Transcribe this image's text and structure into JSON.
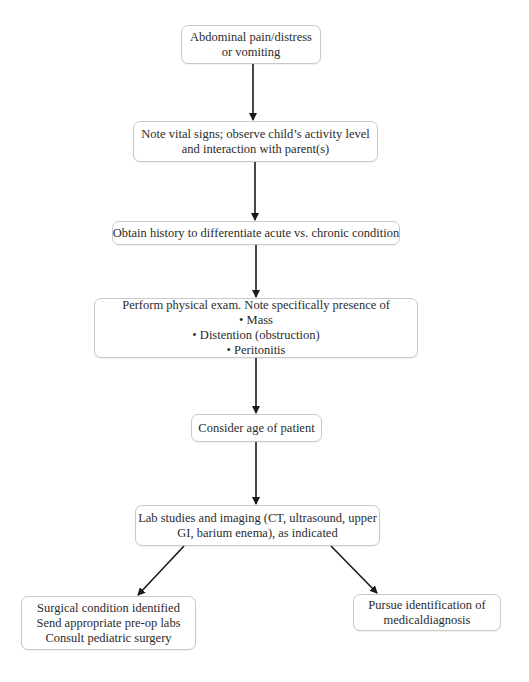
{
  "diagram": {
    "type": "flowchart",
    "top_cut_text": "",
    "nodes": [
      {
        "id": "start",
        "lines": [
          "Abdominal pain/distress",
          "or vomiting"
        ]
      },
      {
        "id": "vitals",
        "lines": [
          "Note vital signs; observe child’s activity level",
          "and interaction with parent(s)"
        ]
      },
      {
        "id": "history",
        "lines": [
          "Obtain history to differentiate acute vs. chronic condition"
        ]
      },
      {
        "id": "exam",
        "lines": [
          "Perform physical exam. Note specifically presence of",
          "• Mass",
          "• Distention (obstruction)",
          "• Peritonitis"
        ]
      },
      {
        "id": "age",
        "lines": [
          "Consider age of patient"
        ]
      },
      {
        "id": "labs",
        "lines": [
          "Lab studies and imaging (CT, ultrasound, upper",
          "GI, barium enema), as indicated"
        ]
      },
      {
        "id": "surgical",
        "lines": [
          "Surgical condition identified",
          "Send appropriate pre-op labs",
          "Consult pediatric surgery"
        ]
      },
      {
        "id": "medical",
        "lines": [
          "Pursue identification of",
          "medicaldiagnosis"
        ]
      }
    ],
    "edges": [
      {
        "from": "start",
        "to": "vitals"
      },
      {
        "from": "vitals",
        "to": "history"
      },
      {
        "from": "history",
        "to": "exam"
      },
      {
        "from": "exam",
        "to": "age"
      },
      {
        "from": "age",
        "to": "labs"
      },
      {
        "from": "labs",
        "to": "surgical"
      },
      {
        "from": "labs",
        "to": "medical"
      }
    ],
    "colors": {
      "box_border": "#c9c9c9",
      "arrow": "#1a1a1a",
      "text": "#2b2b2b",
      "background": "#ffffff"
    }
  }
}
